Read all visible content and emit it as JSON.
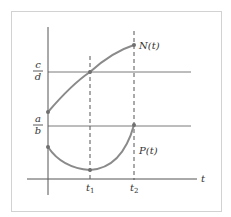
{
  "diagram": {
    "curves": [
      {
        "name": "N(t)",
        "label": "N(t)"
      },
      {
        "name": "P(t)",
        "label": "P(t)"
      }
    ],
    "axis_label": "t",
    "ticks": {
      "t1": "t",
      "t1_sub": "1",
      "t2": "t",
      "t2_sub": "2"
    },
    "levels": {
      "upper": {
        "num": "c",
        "den": "d"
      },
      "lower": {
        "num": "a",
        "den": "b"
      }
    },
    "colors": {
      "curve": "#8a8a8a",
      "point": "#707070",
      "axis": "#555555",
      "level_line": "#777777",
      "frame": "#cfcfcf",
      "text": "#333333"
    }
  }
}
